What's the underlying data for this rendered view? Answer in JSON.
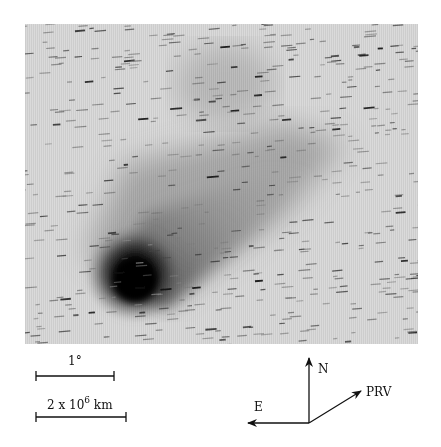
{
  "figure": {
    "photo": {
      "subject": "comet",
      "description": "Greyscale photograph of a comet with dark coma at lower-left and a broad dust tail extending toward upper-right; background filled with trailed star streaks.",
      "colors": {
        "background": "#d8d8d8",
        "coma": "#050505",
        "tail": "#7a7a7a",
        "streak": "#2a2a2a"
      }
    },
    "scale_bars": [
      {
        "label": "1°",
        "x1": 36,
        "x2": 114,
        "y": 376
      },
      {
        "label_prefix": "2 x 10",
        "label_exp": "6",
        "label_suffix": " km",
        "x1": 36,
        "x2": 126,
        "y": 417
      }
    ],
    "compass": {
      "origin": [
        309,
        423
      ],
      "north_label": "N",
      "east_label": "E",
      "velocity_label": "PRV",
      "north_tip": [
        309,
        358
      ],
      "east_tip": [
        248,
        423
      ],
      "velocity_tip": [
        361,
        391
      ],
      "color": "#111111"
    }
  }
}
